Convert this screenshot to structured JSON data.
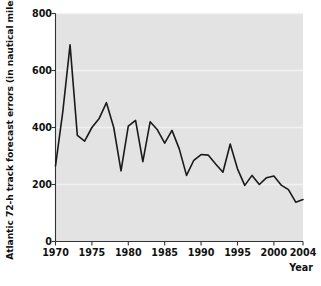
{
  "chart_data": {
    "type": "line",
    "title": "",
    "xlabel": "Year",
    "ylabel": "Atlantic 72-h track forecast errors (in nautical miles)",
    "xlim": [
      1970,
      2004
    ],
    "ylim": [
      0,
      800
    ],
    "xticks": [
      1970,
      1975,
      1980,
      1985,
      1990,
      1995,
      2000,
      2004
    ],
    "yticks": [
      0,
      200,
      400,
      600,
      800
    ],
    "xtick_labels": [
      "1970",
      "1975",
      "1980",
      "1985",
      "1990",
      "1995",
      "2000",
      "2004"
    ],
    "ytick_labels": [
      "0",
      "200",
      "400",
      "600",
      "800"
    ],
    "grid": "horizontal-white",
    "legend": null,
    "series": [
      {
        "name": "Atlantic 72-h track forecast error",
        "color": "#1a1a1a",
        "x": [
          1970,
          1971,
          1972,
          1973,
          1974,
          1975,
          1976,
          1977,
          1978,
          1979,
          1980,
          1981,
          1982,
          1983,
          1984,
          1985,
          1986,
          1987,
          1988,
          1989,
          1990,
          1991,
          1992,
          1993,
          1994,
          1995,
          1996,
          1997,
          1998,
          1999,
          2000,
          2001,
          2002,
          2003,
          2004
        ],
        "values": [
          265,
          455,
          690,
          372,
          352,
          400,
          432,
          487,
          400,
          248,
          405,
          425,
          280,
          420,
          392,
          345,
          390,
          325,
          232,
          285,
          305,
          303,
          272,
          243,
          342,
          255,
          197,
          232,
          200,
          224,
          230,
          198,
          182,
          138,
          147
        ]
      }
    ]
  },
  "axis_label_text": {
    "y": "Atlantic 72-h track forecast errors (in nautical miles)",
    "x": "Year"
  },
  "colors": {
    "plot_background": "#e3e3e3",
    "figure_background": "#ffffff",
    "gridline": "#f2f2f2",
    "axis": "#333333",
    "line": "#1a1a1a",
    "text": "#111111"
  }
}
